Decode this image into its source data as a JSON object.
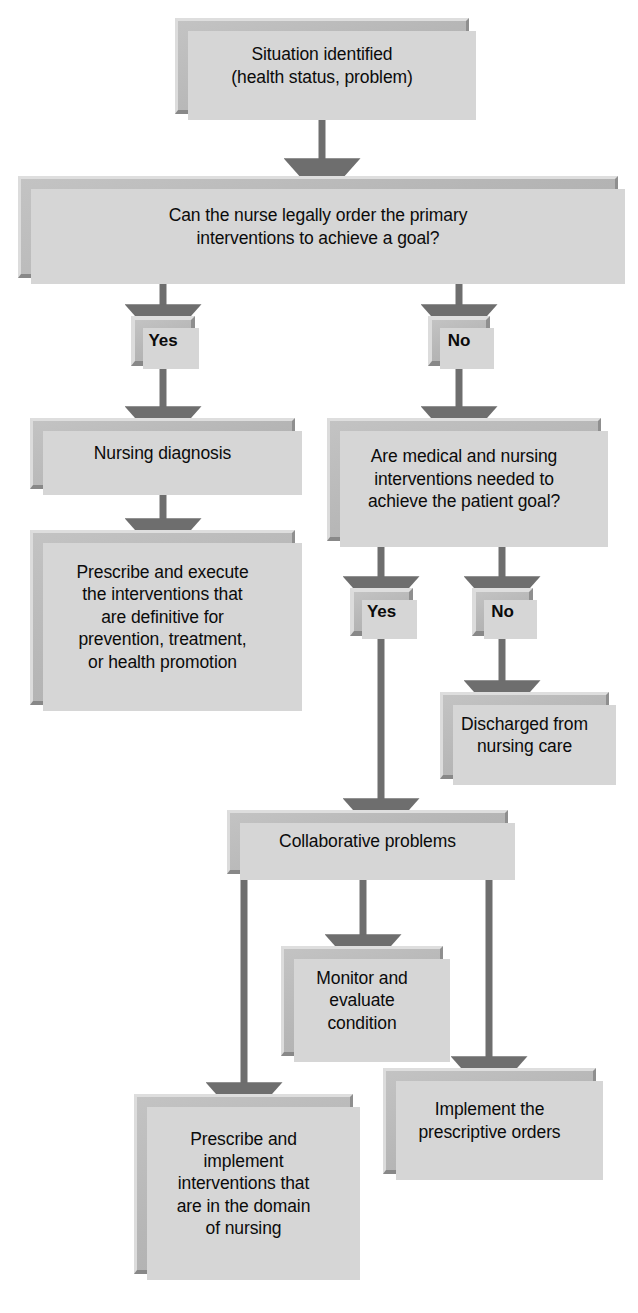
{
  "diagram": {
    "palette": {
      "box_fill": "#b9b9b9",
      "box_highlight": "#dedede",
      "box_shade": "#888888",
      "box_shadow": "#d6d6d6",
      "arrow": "#6e6e6e",
      "text": "#0b0b0b",
      "background": "#ffffff"
    },
    "nodes": [
      {
        "id": "situation",
        "label": "Situation identified\n(health status, problem)"
      },
      {
        "id": "legal_order",
        "label": "Can the nurse legally order the primary\ninterventions to achieve a goal?"
      },
      {
        "id": "yes1",
        "label": "Yes"
      },
      {
        "id": "no1",
        "label": "No"
      },
      {
        "id": "nursing_dx",
        "label": "Nursing diagnosis"
      },
      {
        "id": "med_nurse_q",
        "label": "Are medical and nursing\ninterventions needed to\nachieve the patient goal?"
      },
      {
        "id": "prescribe_exec",
        "label": "Prescribe and execute\nthe interventions that\nare definitive for\nprevention, treatment,\nor health promotion"
      },
      {
        "id": "yes2",
        "label": "Yes"
      },
      {
        "id": "no2",
        "label": "No"
      },
      {
        "id": "discharged",
        "label": "Discharged from\nnursing care"
      },
      {
        "id": "collaborative",
        "label": "Collaborative problems"
      },
      {
        "id": "monitor",
        "label": "Monitor and\nevaluate\ncondition"
      },
      {
        "id": "prescribe_impl",
        "label": "Prescribe and\nimplement\ninterventions that\nare in the domain\nof nursing"
      },
      {
        "id": "implement",
        "label": "Implement the\nprescriptive orders"
      }
    ],
    "edges": [
      {
        "from": "situation",
        "to": "legal_order",
        "label": ""
      },
      {
        "from": "legal_order",
        "to": "yes1",
        "label": "Yes"
      },
      {
        "from": "legal_order",
        "to": "no1",
        "label": "No"
      },
      {
        "from": "yes1",
        "to": "nursing_dx",
        "label": ""
      },
      {
        "from": "no1",
        "to": "med_nurse_q",
        "label": ""
      },
      {
        "from": "nursing_dx",
        "to": "prescribe_exec",
        "label": ""
      },
      {
        "from": "med_nurse_q",
        "to": "yes2",
        "label": "Yes"
      },
      {
        "from": "med_nurse_q",
        "to": "no2",
        "label": "No"
      },
      {
        "from": "no2",
        "to": "discharged",
        "label": ""
      },
      {
        "from": "yes2",
        "to": "collaborative",
        "label": ""
      },
      {
        "from": "collaborative",
        "to": "prescribe_impl",
        "label": ""
      },
      {
        "from": "collaborative",
        "to": "monitor",
        "label": ""
      },
      {
        "from": "collaborative",
        "to": "implement",
        "label": ""
      }
    ]
  }
}
